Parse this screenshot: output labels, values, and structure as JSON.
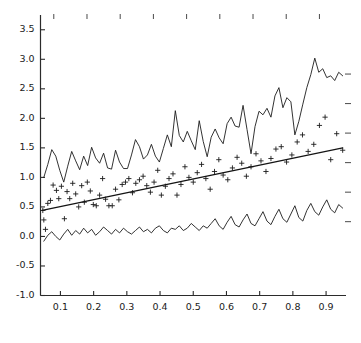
{
  "chart_data": {
    "type": "line",
    "title": "",
    "subtitle": "",
    "xlabel": "",
    "ylabel": "",
    "xlim": [
      0.04,
      0.96
    ],
    "ylim": [
      -1.0,
      3.75
    ],
    "grid": false,
    "legend": "none",
    "legend_position": "none",
    "x_ticks": [
      0.1,
      0.2,
      0.3,
      0.4,
      0.5,
      0.6,
      0.7,
      0.8,
      0.9
    ],
    "x_tick_labels": [
      "0.1",
      "0.2",
      "0.3",
      "0.4",
      "0.5",
      "0.6",
      "0.7",
      "0.8",
      "0.9"
    ],
    "y_ticks": [
      -1.0,
      -0.5,
      0.0,
      0.5,
      1.0,
      1.5,
      2.0,
      2.5,
      3.0,
      3.5
    ],
    "y_tick_labels": [
      "-1.0",
      "-0.5",
      "0.0",
      "0.5",
      "1.0",
      "1.5",
      "2.0",
      "2.5",
      "3.0",
      "3.5"
    ],
    "top_ticks": [
      0.08,
      0.18,
      0.28,
      0.38,
      0.48,
      0.58,
      0.68,
      0.78,
      0.88
    ],
    "right_ticks": [
      0.25,
      0.75,
      1.25,
      1.75,
      2.25,
      2.75
    ],
    "colors": {
      "line": "#1c1c1c",
      "marker": "#1c1c1c",
      "fit": "#141414",
      "axis": "#2b2b2b",
      "background": "#ffffff"
    },
    "series": [
      {
        "name": "upper-noisy-line",
        "type": "line",
        "marker": "none",
        "x": [
          0.05,
          0.062,
          0.074,
          0.086,
          0.098,
          0.11,
          0.122,
          0.134,
          0.146,
          0.158,
          0.17,
          0.182,
          0.194,
          0.206,
          0.218,
          0.23,
          0.242,
          0.254,
          0.266,
          0.278,
          0.29,
          0.302,
          0.314,
          0.326,
          0.338,
          0.35,
          0.362,
          0.374,
          0.386,
          0.398,
          0.41,
          0.422,
          0.434,
          0.446,
          0.458,
          0.47,
          0.482,
          0.494,
          0.506,
          0.518,
          0.53,
          0.542,
          0.554,
          0.566,
          0.578,
          0.59,
          0.602,
          0.614,
          0.626,
          0.638,
          0.65,
          0.662,
          0.674,
          0.686,
          0.698,
          0.71,
          0.722,
          0.734,
          0.746,
          0.758,
          0.77,
          0.782,
          0.794,
          0.806,
          0.818,
          0.83,
          0.842,
          0.854,
          0.866,
          0.878,
          0.89,
          0.902,
          0.914,
          0.926,
          0.938,
          0.95
        ],
        "y": [
          1.0,
          1.22,
          1.47,
          1.36,
          1.12,
          0.92,
          1.19,
          1.44,
          1.28,
          1.13,
          1.36,
          1.2,
          1.51,
          1.33,
          1.24,
          1.41,
          1.16,
          1.14,
          1.46,
          1.26,
          1.15,
          1.15,
          1.38,
          1.64,
          1.52,
          1.31,
          1.38,
          1.56,
          1.36,
          1.26,
          1.49,
          1.72,
          1.52,
          2.13,
          1.71,
          1.6,
          1.78,
          1.62,
          1.47,
          1.96,
          1.61,
          1.35,
          1.68,
          1.82,
          1.67,
          1.57,
          1.91,
          2.02,
          1.87,
          1.85,
          2.22,
          1.81,
          1.4,
          1.86,
          2.12,
          2.06,
          2.17,
          2.02,
          2.38,
          2.52,
          2.18,
          2.35,
          2.28,
          1.72,
          1.95,
          2.24,
          2.52,
          2.74,
          3.02,
          2.78,
          2.84,
          2.69,
          2.72,
          2.64,
          2.78,
          2.72
        ]
      },
      {
        "name": "scatter-points",
        "type": "scatter",
        "marker": "plus",
        "x": [
          0.047,
          0.05,
          0.055,
          0.062,
          0.07,
          0.078,
          0.088,
          0.095,
          0.103,
          0.112,
          0.12,
          0.128,
          0.137,
          0.146,
          0.155,
          0.164,
          0.172,
          0.181,
          0.19,
          0.199,
          0.208,
          0.218,
          0.227,
          0.236,
          0.246,
          0.256,
          0.266,
          0.276,
          0.286,
          0.296,
          0.306,
          0.317,
          0.327,
          0.338,
          0.349,
          0.36,
          0.371,
          0.382,
          0.393,
          0.404,
          0.416,
          0.427,
          0.439,
          0.451,
          0.463,
          0.475,
          0.487,
          0.5,
          0.512,
          0.525,
          0.538,
          0.551,
          0.564,
          0.577,
          0.59,
          0.604,
          0.618,
          0.632,
          0.646,
          0.66,
          0.674,
          0.689,
          0.704,
          0.719,
          0.734,
          0.749,
          0.765,
          0.781,
          0.797,
          0.813,
          0.829,
          0.846,
          0.863,
          0.88,
          0.897,
          0.914,
          0.932,
          0.95
        ],
        "y": [
          0.44,
          0.28,
          0.12,
          0.56,
          0.61,
          0.87,
          0.78,
          0.64,
          0.85,
          0.3,
          0.76,
          0.64,
          0.9,
          0.72,
          0.5,
          0.86,
          0.58,
          0.92,
          0.77,
          0.54,
          0.52,
          0.7,
          0.98,
          0.63,
          0.52,
          0.52,
          0.8,
          0.62,
          0.88,
          0.92,
          0.98,
          0.74,
          0.9,
          0.96,
          1.02,
          0.86,
          0.75,
          0.92,
          1.12,
          0.7,
          0.85,
          0.98,
          1.06,
          0.7,
          0.88,
          1.18,
          1.0,
          0.92,
          1.08,
          1.22,
          0.98,
          0.8,
          1.1,
          1.3,
          1.04,
          0.96,
          1.16,
          1.34,
          1.24,
          1.02,
          1.18,
          1.4,
          1.28,
          1.1,
          1.32,
          1.48,
          1.52,
          1.26,
          1.38,
          1.6,
          1.72,
          1.44,
          1.56,
          1.88,
          2.02,
          1.3,
          1.74,
          1.46
        ]
      },
      {
        "name": "regression-fit-line",
        "type": "line",
        "marker": "none",
        "x": [
          0.045,
          0.95
        ],
        "y": [
          0.44,
          1.5
        ]
      },
      {
        "name": "lower-noisy-line",
        "type": "line",
        "marker": "none",
        "x": [
          0.05,
          0.062,
          0.074,
          0.086,
          0.098,
          0.11,
          0.122,
          0.134,
          0.146,
          0.158,
          0.17,
          0.182,
          0.194,
          0.206,
          0.218,
          0.23,
          0.242,
          0.254,
          0.266,
          0.278,
          0.29,
          0.302,
          0.314,
          0.326,
          0.338,
          0.35,
          0.362,
          0.374,
          0.386,
          0.398,
          0.41,
          0.422,
          0.434,
          0.446,
          0.458,
          0.47,
          0.482,
          0.494,
          0.506,
          0.518,
          0.53,
          0.542,
          0.554,
          0.566,
          0.578,
          0.59,
          0.602,
          0.614,
          0.626,
          0.638,
          0.65,
          0.662,
          0.674,
          0.686,
          0.698,
          0.71,
          0.722,
          0.734,
          0.746,
          0.758,
          0.77,
          0.782,
          0.794,
          0.806,
          0.818,
          0.83,
          0.842,
          0.854,
          0.866,
          0.878,
          0.89,
          0.902,
          0.914,
          0.926,
          0.938,
          0.95
        ],
        "y": [
          -0.08,
          0.02,
          0.08,
          0.0,
          -0.06,
          0.04,
          0.12,
          0.02,
          0.1,
          0.04,
          0.14,
          0.06,
          0.12,
          0.02,
          0.08,
          0.16,
          0.1,
          0.04,
          0.12,
          0.06,
          0.14,
          0.08,
          0.04,
          0.1,
          0.16,
          0.08,
          0.12,
          0.06,
          0.14,
          0.18,
          0.1,
          0.06,
          0.14,
          0.12,
          0.18,
          0.1,
          0.14,
          0.22,
          0.16,
          0.1,
          0.18,
          0.14,
          0.22,
          0.3,
          0.18,
          0.12,
          0.24,
          0.34,
          0.2,
          0.16,
          0.28,
          0.38,
          0.22,
          0.18,
          0.3,
          0.42,
          0.26,
          0.2,
          0.34,
          0.46,
          0.3,
          0.24,
          0.38,
          0.52,
          0.32,
          0.26,
          0.44,
          0.56,
          0.42,
          0.36,
          0.5,
          0.62,
          0.46,
          0.4,
          0.54,
          0.48
        ]
      }
    ]
  }
}
